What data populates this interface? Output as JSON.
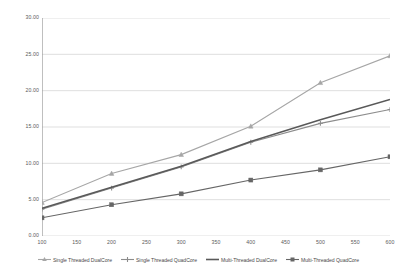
{
  "chart_data": {
    "type": "line",
    "title": "",
    "subtitle": "",
    "xlabel": "",
    "ylabel": "",
    "xlim": [
      100,
      600
    ],
    "ylim": [
      0,
      30
    ],
    "grid": true,
    "legend_position": "bottom",
    "x": [
      100,
      200,
      300,
      400,
      500,
      600
    ],
    "x_tick_labels": [
      "100",
      "150",
      "200",
      "250",
      "300",
      "350",
      "400",
      "450",
      "500",
      "550",
      "600"
    ],
    "x_ticks": [
      100,
      150,
      200,
      250,
      300,
      350,
      400,
      450,
      500,
      550,
      600
    ],
    "y_tick_labels": [
      "0.00",
      "5.00",
      "10.00",
      "15.00",
      "20.00",
      "25.00",
      "30.00"
    ],
    "y_ticks": [
      0,
      5,
      10,
      15,
      20,
      25,
      30
    ],
    "series": [
      {
        "name": "Single Threaded DualCore",
        "marker": "triangle",
        "color": "#a6a6a6",
        "values": [
          4.6,
          8.6,
          11.2,
          15.1,
          21.1,
          24.8
        ]
      },
      {
        "name": "Single Threaded QuadCore",
        "marker": "cross",
        "color": "#8c8c8c",
        "values": [
          3.7,
          6.6,
          9.5,
          12.9,
          15.5,
          17.4
        ]
      },
      {
        "name": "Multi-Threaded DualCore",
        "marker": "none",
        "color": "#595959",
        "values": [
          3.8,
          6.7,
          9.6,
          13.0,
          16.0,
          18.8
        ]
      },
      {
        "name": "Multi-Threaded QuadCore",
        "marker": "square",
        "color": "#666666",
        "values": [
          2.5,
          4.3,
          5.8,
          7.7,
          9.1,
          10.9
        ]
      }
    ]
  },
  "axis": {
    "gridline_color": "#c9c9c9",
    "axis_line_color": "#9a9a9a",
    "background": "#ffffff"
  },
  "legend": {
    "items": [
      {
        "label": "Single Threaded DualCore",
        "icon": "line-triangle-marker-icon"
      },
      {
        "label": "Single Threaded QuadCore",
        "icon": "line-cross-marker-icon"
      },
      {
        "label": "Multi-Threaded DualCore",
        "icon": "line-plain-icon"
      },
      {
        "label": "Multi-Threaded QuadCore",
        "icon": "line-square-marker-icon"
      }
    ]
  }
}
